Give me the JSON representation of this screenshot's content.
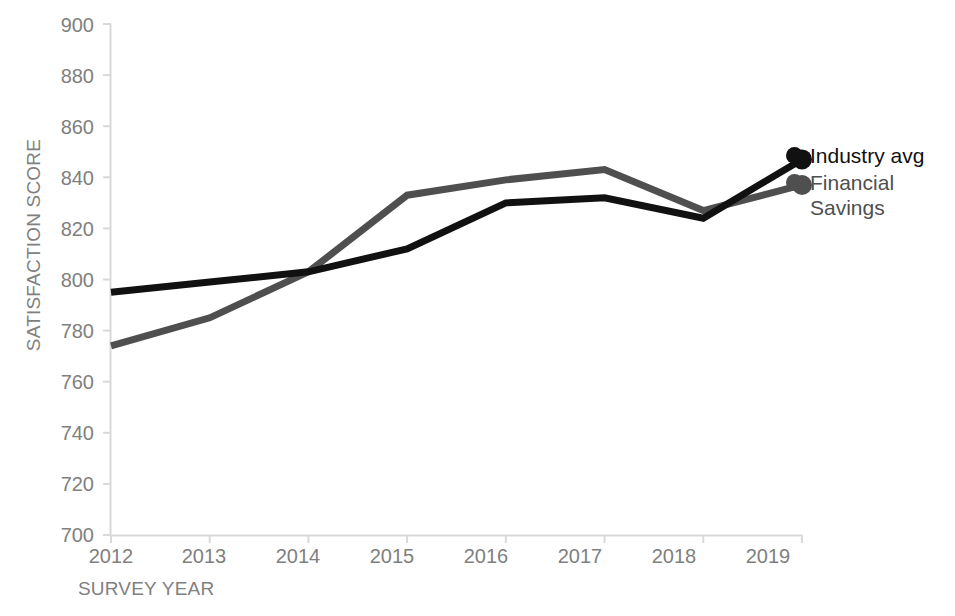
{
  "chart_data": {
    "type": "line",
    "title": "",
    "xlabel": "SURVEY YEAR",
    "ylabel": "SATISFACTION SCORE",
    "categories": [
      "2012",
      "2013",
      "2014",
      "2015",
      "2016",
      "2017",
      "2018",
      "2019"
    ],
    "x": [
      2012,
      2013,
      2014,
      2015,
      2016,
      2017,
      2018,
      2019
    ],
    "xlim": [
      2012,
      2019
    ],
    "ylim": [
      700,
      900
    ],
    "y_ticks": [
      700,
      720,
      740,
      760,
      780,
      800,
      820,
      840,
      860,
      880,
      900
    ],
    "x_ticks": [
      "2012",
      "2013",
      "2014",
      "2015",
      "2016",
      "2017",
      "2018",
      "2019"
    ],
    "grid": false,
    "legend_position": "right-of-plot-endpoints",
    "end_markers": true,
    "series": [
      {
        "name": "Industry avg",
        "color": "#111111",
        "values": [
          795,
          799,
          803,
          812,
          830,
          832,
          824,
          847
        ]
      },
      {
        "name": "Financial Savings",
        "color": "#4f4f4f",
        "values": [
          774,
          785,
          803,
          833,
          839,
          843,
          827,
          837
        ]
      }
    ]
  },
  "axis": {
    "y_title": "SATISFACTION SCORE",
    "x_title": "SURVEY YEAR",
    "y_tick_labels": [
      "900",
      "880",
      "860",
      "840",
      "820",
      "800",
      "780",
      "760",
      "740",
      "720",
      "700"
    ],
    "x_tick_labels": [
      "2012",
      "2013",
      "2014",
      "2015",
      "2016",
      "2017",
      "2018",
      "2019"
    ],
    "axis_color": "#d9d9d9",
    "tick_label_color": "#808080"
  },
  "legend": {
    "items": [
      {
        "label": "Industry avg",
        "color": "#111111"
      },
      {
        "label": "Financial\nSavings",
        "color": "#4f4f4f"
      }
    ]
  }
}
